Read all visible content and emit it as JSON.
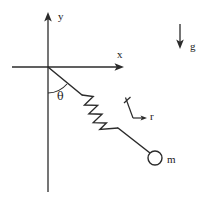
{
  "figure": {
    "kind": "physics-free-body-diagram",
    "background_color": "#ffffff",
    "ink_color": "#2b2b2b"
  },
  "axes": {
    "origin": {
      "x": 48,
      "y": 67
    },
    "y_axis": {
      "label": "y",
      "label_x": 58,
      "label_y": 17,
      "top_y": 13,
      "bottom_y": 192,
      "arrow": "up"
    },
    "x_axis": {
      "label": "x",
      "label_x": 118,
      "label_y": 58,
      "left_x": 12,
      "right_x": 122,
      "arrow": "right"
    }
  },
  "angle": {
    "symbol": "θ",
    "label_x": 57,
    "label_y": 99,
    "measured_from": "negative y axis",
    "measured_to": "spring rod",
    "arc_radius": 26
  },
  "pendulum": {
    "rod_start": {
      "x": 48,
      "y": 67
    },
    "rod_end": {
      "x": 150,
      "y": 152
    },
    "upper_segment_end": {
      "x": 82,
      "y": 95
    },
    "lower_segment_start": {
      "x": 118,
      "y": 128
    },
    "spring": {
      "coil_count": 4,
      "amplitude": 9,
      "start": {
        "x": 82,
        "y": 95
      },
      "end": {
        "x": 118,
        "y": 128
      }
    }
  },
  "mass": {
    "label": "m",
    "label_x": 166,
    "label_y": 163,
    "center": {
      "x": 155,
      "y": 158
    },
    "radius": 7
  },
  "radial_vector": {
    "label": "r",
    "label_x": 150,
    "label_y": 119,
    "tick_start": {
      "x": 125,
      "y": 98
    },
    "corner": {
      "x": 133,
      "y": 118
    },
    "tip": {
      "x": 146,
      "y": 118
    },
    "description": "unit vector r pointing away from origin along the rod"
  },
  "gravity_vector": {
    "label": "g",
    "label_x": 191,
    "label_y": 50,
    "top": {
      "x": 180,
      "y": 24
    },
    "bottom": {
      "x": 180,
      "y": 48
    },
    "direction": "down"
  }
}
